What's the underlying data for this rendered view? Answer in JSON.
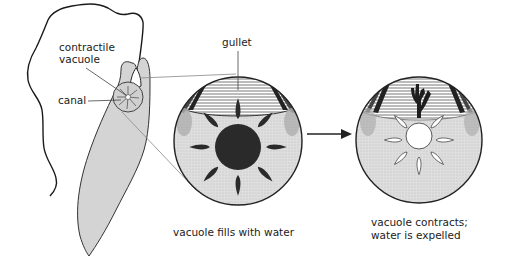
{
  "diagram": {
    "labels": {
      "contractile_vacuole_line1": "contractile",
      "contractile_vacuole_line2": "vacuole",
      "canal": "canal",
      "gullet": "gullet"
    },
    "panels": [
      {
        "id": "fills",
        "caption": "vacuole fills with water",
        "vacuole_state": "filled (dark)",
        "canals": "dark, full"
      },
      {
        "id": "contracts",
        "caption_line1": "vacuole contracts;",
        "caption_line2": "water is expelled",
        "vacuole_state": "emptied (white)",
        "canals": "white, empty"
      }
    ],
    "arrow": "right-arrow",
    "colors": {
      "body_fill": "#d4d4d4",
      "cytoplasm_fill": "#dcdcdc",
      "vacuole_dark": "#2a2a2a",
      "outline": "#1a1a1a",
      "leader_line": "#888888",
      "background": "#ffffff"
    }
  }
}
